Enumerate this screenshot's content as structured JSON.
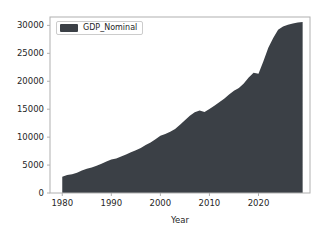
{
  "chart_data": {
    "type": "area",
    "title": "",
    "xlabel": "Year",
    "ylabel": "",
    "legend": [
      "GDP_Nominal"
    ],
    "legend_position": "upper left",
    "grid": false,
    "xlim": [
      1977.5,
      2030.5
    ],
    "ylim": [
      0,
      31500
    ],
    "xticks": [
      1980,
      1990,
      2000,
      2010,
      2020
    ],
    "yticks": [
      0,
      5000,
      10000,
      15000,
      20000,
      25000,
      30000
    ],
    "xtick_labels": [
      "1980",
      "1990",
      "2000",
      "2010",
      "2020"
    ],
    "ytick_labels": [
      "0",
      "5000",
      "10000",
      "15000",
      "20000",
      "25000",
      "30000"
    ],
    "colors": {
      "series_fill": "#3b4046",
      "background": "#ffffff",
      "spine": "#b0b0b0",
      "text": "#262626",
      "legend_border": "#cccccc"
    },
    "series": [
      {
        "name": "GDP_Nominal",
        "x": [
          1980,
          1981,
          1982,
          1983,
          1984,
          1985,
          1986,
          1987,
          1988,
          1989,
          1990,
          1991,
          1992,
          1993,
          1994,
          1995,
          1996,
          1997,
          1998,
          1999,
          2000,
          2001,
          2002,
          2003,
          2004,
          2005,
          2006,
          2007,
          2008,
          2009,
          2010,
          2011,
          2012,
          2013,
          2014,
          2015,
          2016,
          2017,
          2018,
          2019,
          2020,
          2021,
          2022,
          2023,
          2024,
          2025,
          2026,
          2027,
          2028,
          2029
        ],
        "values": [
          2900,
          3200,
          3350,
          3640,
          4040,
          4340,
          4580,
          4860,
          5250,
          5660,
          5980,
          6170,
          6540,
          6880,
          7310,
          7640,
          8070,
          8580,
          9060,
          9630,
          10250,
          10580,
          10940,
          11460,
          12210,
          13040,
          13820,
          14450,
          14770,
          14480,
          15050,
          15600,
          16250,
          16880,
          17610,
          18300,
          18800,
          19610,
          20660,
          21540,
          21350,
          23590,
          26010,
          27720,
          29200,
          29800,
          30100,
          30350,
          30500,
          30600
        ]
      }
    ]
  },
  "legend": {
    "swatch_color": "#3b4046",
    "label": "GDP_Nominal"
  },
  "axis": {
    "xlabel": "Year"
  }
}
